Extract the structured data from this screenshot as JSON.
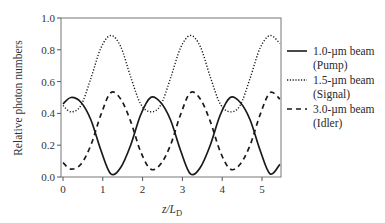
{
  "chart_data": {
    "type": "line",
    "title": "",
    "xlabel": "z/L_D",
    "xlabel_main": "z/L",
    "xlabel_sub": "D",
    "ylabel": "Relative photon numbers",
    "xlim": [
      0,
      5.45
    ],
    "ylim": [
      0.0,
      1.0
    ],
    "xticks": [
      "0",
      "1",
      "2",
      "3",
      "4",
      "5"
    ],
    "yticks": [
      "0.0",
      "0.2",
      "0.4",
      "0.6",
      "0.8",
      "1.0"
    ],
    "grid": false,
    "legend_position": "right-outside",
    "x": [
      0,
      0.2,
      0.45,
      0.7,
      0.95,
      1.2,
      1.45,
      1.7,
      1.95,
      2.2,
      2.45,
      2.7,
      2.95,
      3.2,
      3.45,
      3.7,
      3.95,
      4.2,
      4.45,
      4.7,
      4.95,
      5.2,
      5.45
    ],
    "series": [
      {
        "name": "1.0-µm beam (Pump)",
        "style": "solid",
        "values": [
          0.46,
          0.5,
          0.47,
          0.36,
          0.17,
          0.02,
          0.06,
          0.2,
          0.39,
          0.5,
          0.47,
          0.36,
          0.17,
          0.02,
          0.06,
          0.2,
          0.39,
          0.5,
          0.47,
          0.36,
          0.17,
          0.02,
          0.08
        ]
      },
      {
        "name": "1.5-µm beam (Signal)",
        "style": "dotted",
        "values": [
          0.45,
          0.41,
          0.45,
          0.62,
          0.81,
          0.89,
          0.82,
          0.63,
          0.46,
          0.41,
          0.45,
          0.62,
          0.81,
          0.89,
          0.82,
          0.63,
          0.46,
          0.41,
          0.45,
          0.62,
          0.81,
          0.89,
          0.84
        ]
      },
      {
        "name": "3.0-µm beam (Idler)",
        "style": "dashed",
        "values": [
          0.09,
          0.05,
          0.08,
          0.2,
          0.39,
          0.53,
          0.49,
          0.35,
          0.16,
          0.05,
          0.08,
          0.2,
          0.39,
          0.53,
          0.49,
          0.35,
          0.16,
          0.05,
          0.08,
          0.2,
          0.39,
          0.53,
          0.49
        ]
      }
    ]
  },
  "legend": {
    "items": [
      {
        "line1": "1.0-µm beam",
        "line2": "(Pump)",
        "style": "solid"
      },
      {
        "line1": "1.5-µm beam",
        "line2": "(Signal)",
        "style": "dotted"
      },
      {
        "line1": "3.0-µm beam",
        "line2": "(Idler)",
        "style": "dashed"
      }
    ]
  }
}
